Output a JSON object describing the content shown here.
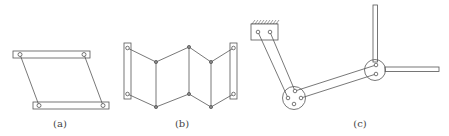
{
  "figure": {
    "stroke_color": "#555555",
    "background": "#ffffff",
    "panels": [
      {
        "id": "a",
        "label": "(a)",
        "description": "Four-bar parallelogram linkage"
      },
      {
        "id": "b",
        "label": "(b)",
        "description": "Chained zig-zag linkage between two fixed end bars"
      },
      {
        "id": "c",
        "label": "(c)",
        "description": "Grounded linkage arm with circular joint hubs and perpendicular output bars"
      }
    ]
  }
}
